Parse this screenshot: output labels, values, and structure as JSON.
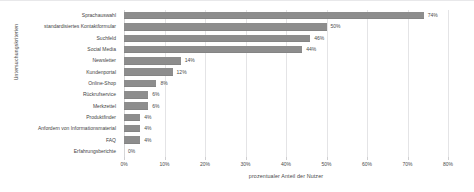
{
  "chart_data": {
    "type": "bar",
    "orientation": "horizontal",
    "title": "",
    "xlabel": "prozentualer Anteil der Nutzer",
    "ylabel": "Untersuchungskriterien",
    "xlim": [
      0,
      80
    ],
    "xticks": [
      "0%",
      "10%",
      "20%",
      "30%",
      "40%",
      "50%",
      "60%",
      "70%",
      "80%"
    ],
    "xtick_values": [
      0,
      10,
      20,
      30,
      40,
      50,
      60,
      70,
      80
    ],
    "grid": true,
    "legend": false,
    "bar_color": "#8d8d8d",
    "categories": [
      "Sprachauswahl",
      "standardisiertes Kontaktformular",
      "Suchfeld",
      "Social Media",
      "Newsletter",
      "Kundenportal",
      "Online-Shop",
      "Rückrufservice",
      "Merkzettel",
      "Produktfinder",
      "Anfordern von Informationsmaterial",
      "FAQ",
      "Erfahrungsberichte"
    ],
    "values": [
      74,
      50,
      46,
      44,
      14,
      12,
      8,
      6,
      6,
      4,
      4,
      4,
      0
    ],
    "data_labels": [
      "74%",
      "50%",
      "46%",
      "44%",
      "14%",
      "12%",
      "8%",
      "6%",
      "6%",
      "4%",
      "4%",
      "4%",
      "0%"
    ]
  }
}
